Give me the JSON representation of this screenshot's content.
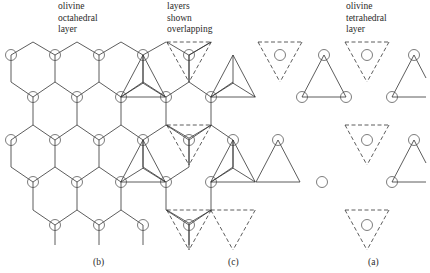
{
  "figure": {
    "labels": {
      "octahedral": [
        "olivine",
        "octahedral",
        "layer"
      ],
      "overlap": [
        "layers",
        "shown",
        "overlapping"
      ],
      "tetrahedral": [
        "olivine",
        "tetrahedral",
        "layer"
      ]
    },
    "captions": {
      "b": "(b)",
      "c": "(c)",
      "a": "(a)"
    },
    "colors": {
      "line": "#333333",
      "background": "#ffffff"
    },
    "panels": [
      {
        "id": "b",
        "description": "olivine octahedral layer — honeycomb net with circled cation positions"
      },
      {
        "id": "c",
        "description": "octahedral and tetrahedral layers shown overlapping"
      },
      {
        "id": "a",
        "description": "olivine tetrahedral layer — isolated up (solid) and down (dashed) triangles"
      }
    ]
  }
}
